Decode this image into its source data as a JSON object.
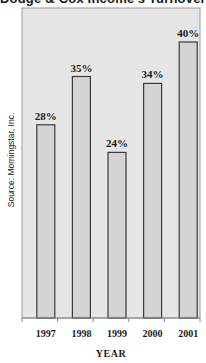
{
  "chart_data": {
    "type": "bar",
    "title": "Dodge & Cox Income's Turnover Rate",
    "categories": [
      "1997",
      "1998",
      "1999",
      "2000",
      "2001"
    ],
    "values": [
      28,
      35,
      24,
      34,
      40
    ],
    "value_labels": [
      "28%",
      "35%",
      "24%",
      "34%",
      "40%"
    ],
    "xlabel": "Year",
    "ylabel": "",
    "ylim": [
      0,
      40
    ],
    "grid": false,
    "source": "Source: Morningstar, Inc.",
    "colors": {
      "plot_background": "#e6e6e6",
      "bar_fill": "#d4d4d4",
      "bar_stroke": "#3a3a3a",
      "frame_stroke": "#9a9a9a",
      "text": "#1a1a1a"
    }
  }
}
